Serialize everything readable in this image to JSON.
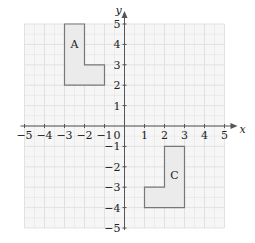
{
  "diagram": {
    "type": "coordinate-grid",
    "x_axis": {
      "label": "x",
      "min": -5,
      "max": 5,
      "ticks": [
        "-5",
        "-4",
        "-3",
        "-2",
        "-1",
        "1",
        "2",
        "3",
        "4",
        "5"
      ]
    },
    "y_axis": {
      "label": "y",
      "min": -5,
      "max": 5,
      "ticks": [
        "5",
        "4",
        "3",
        "2",
        "1",
        "-1",
        "-2",
        "-3",
        "-4",
        "-5"
      ]
    },
    "origin_label": "0",
    "shapes": [
      {
        "name": "A",
        "label": "A",
        "label_at": [
          -2.5,
          3.8
        ],
        "points": [
          [
            -3,
            5
          ],
          [
            -2,
            5
          ],
          [
            -2,
            3
          ],
          [
            -1,
            3
          ],
          [
            -1,
            2
          ],
          [
            -3,
            2
          ]
        ]
      },
      {
        "name": "C",
        "label": "C",
        "label_at": [
          2.5,
          -2.6
        ],
        "points": [
          [
            2,
            -1
          ],
          [
            3,
            -1
          ],
          [
            3,
            -4
          ],
          [
            1,
            -4
          ],
          [
            1,
            -3
          ],
          [
            2,
            -3
          ]
        ]
      }
    ],
    "colors": {
      "grid": "#dcdcdc",
      "grid_fill": "#f6f6f6",
      "axis": "#555555",
      "shape_fill": "#ebebeb",
      "shape_stroke": "#777777"
    }
  }
}
